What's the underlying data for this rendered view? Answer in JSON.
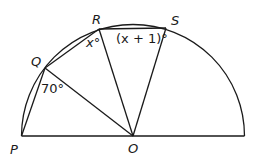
{
  "diagram": {
    "points": {
      "P": "P",
      "Q": "Q",
      "R": "R",
      "S": "S",
      "O": "O"
    },
    "angles": {
      "angle_PQO": "70°",
      "angle_QRO": "x°",
      "angle_RSO_x": "(x + 1)°"
    },
    "colors": {
      "stroke": "#1a1a1a",
      "background": "#ffffff"
    }
  }
}
